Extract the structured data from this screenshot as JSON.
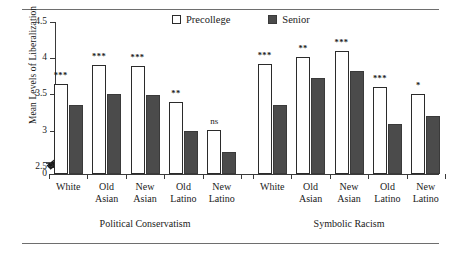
{
  "chart_data": {
    "type": "bar",
    "title": "",
    "xlabel": "",
    "ylabel": "Mean Levels of Liberalization",
    "ylim": [
      2.4,
      4.5
    ],
    "yticks": [
      4.5,
      4,
      3.5,
      3,
      2.5,
      0
    ],
    "ytick_labels": [
      "4.5",
      "4",
      "3.5",
      "3",
      "2.5",
      "0"
    ],
    "axis_break": true,
    "grid": false,
    "legend_position": "top-right",
    "categories": [
      "White",
      "Old Asian",
      "New Asian",
      "Old Latino",
      "New Latino",
      "White",
      "Old Asian",
      "New Asian",
      "Old Latino",
      "New Latino"
    ],
    "groups": [
      {
        "name": "Political Conservatism",
        "categories": [
          "White",
          "Old Asian",
          "New Asian",
          "Old Latino",
          "New Latino"
        ],
        "precollege": [
          3.65,
          3.91,
          3.89,
          3.4,
          3.01
        ],
        "senior": [
          3.35,
          3.51,
          3.49,
          3.0,
          2.7
        ],
        "significance": [
          "***",
          "***",
          "***",
          "**",
          "ns"
        ]
      },
      {
        "name": "Symbolic Racism",
        "categories": [
          "White",
          "Old Asian",
          "New Asian",
          "Old Latino",
          "New Latino"
        ],
        "precollege": [
          3.92,
          4.01,
          4.1,
          3.6,
          3.51
        ],
        "senior": [
          3.36,
          3.72,
          3.83,
          3.09,
          3.2
        ],
        "significance": [
          "***",
          "**",
          "***",
          "***",
          "*"
        ]
      }
    ],
    "series": [
      {
        "name": "Precollege",
        "values": [
          3.65,
          3.91,
          3.89,
          3.4,
          3.01,
          3.92,
          4.01,
          4.1,
          3.6,
          3.51
        ]
      },
      {
        "name": "Senior",
        "values": [
          3.35,
          3.51,
          3.49,
          3.0,
          2.7,
          3.36,
          3.72,
          3.83,
          3.09,
          3.2
        ]
      }
    ],
    "annotations": [
      "***",
      "***",
      "***",
      "**",
      "ns",
      "***",
      "**",
      "***",
      "***",
      "*"
    ]
  },
  "legend": {
    "items": [
      {
        "label": "Precollege",
        "swatch": "open-square",
        "color": "#ffffff"
      },
      {
        "label": "Senior",
        "swatch": "filled-square",
        "color": "#4b4b4b"
      }
    ]
  },
  "axes": {
    "y_title": "Mean Levels of Liberalization",
    "y_tick_labels": [
      "4.5",
      "4",
      "3.5",
      "3",
      "2.5",
      "0"
    ]
  },
  "group_titles": [
    "Political Conservatism",
    "Symbolic Racism"
  ],
  "x_labels": [
    {
      "line1": "White",
      "line2": ""
    },
    {
      "line1": "Old",
      "line2": "Asian"
    },
    {
      "line1": "New",
      "line2": "Asian"
    },
    {
      "line1": "Old",
      "line2": "Latino"
    },
    {
      "line1": "New",
      "line2": "Latino"
    },
    {
      "line1": "White",
      "line2": ""
    },
    {
      "line1": "Old",
      "line2": "Asian"
    },
    {
      "line1": "New",
      "line2": "Asian"
    },
    {
      "line1": "Old",
      "line2": "Latino"
    },
    {
      "line1": "New",
      "line2": "Latino"
    }
  ]
}
